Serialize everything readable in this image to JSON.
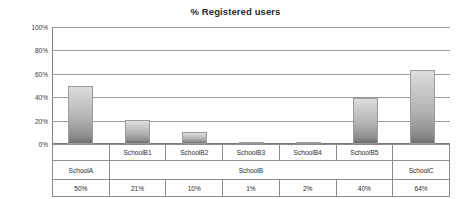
{
  "chart_data": {
    "type": "bar",
    "title": "% Registered users",
    "xlabel": "",
    "ylabel": "",
    "categories": [
      "SchoolA",
      "SchoolB1",
      "SchoolB2",
      "SchoolB3",
      "SchoolB4",
      "SchoolB5",
      "SchoolC"
    ],
    "values": [
      50,
      21,
      10,
      1,
      2,
      40,
      64
    ],
    "value_labels": [
      "50%",
      "21%",
      "10%",
      "1%",
      "2%",
      "40%",
      "64%"
    ],
    "groups": [
      {
        "label": "SchoolA",
        "span": 1
      },
      {
        "label": "SchoolB",
        "span": 5
      },
      {
        "label": "SchoolC",
        "span": 1
      }
    ],
    "ylim": [
      0,
      100
    ],
    "yticks": [
      0,
      20,
      40,
      60,
      80,
      100
    ],
    "ytick_labels": [
      "0%",
      "20%",
      "40%",
      "60%",
      "80%",
      "100%"
    ],
    "grid": true,
    "legend": "none",
    "bar_color_top": "#dedede",
    "bar_color_bottom": "#6f6f6f",
    "gridline_color": "#9a9a9a",
    "axis_color": "#7d7d7d",
    "text_color": "#2b2b2b"
  },
  "table": {
    "row_sub_header": [
      "",
      "SchoolB1",
      "SchoolB2",
      "SchoolB3",
      "SchoolB4",
      "SchoolB5",
      ""
    ],
    "row_group": [
      "SchoolA",
      "SchoolB",
      "SchoolC"
    ],
    "row_values": [
      "50%",
      "21%",
      "10%",
      "1%",
      "2%",
      "40%",
      "64%"
    ]
  }
}
